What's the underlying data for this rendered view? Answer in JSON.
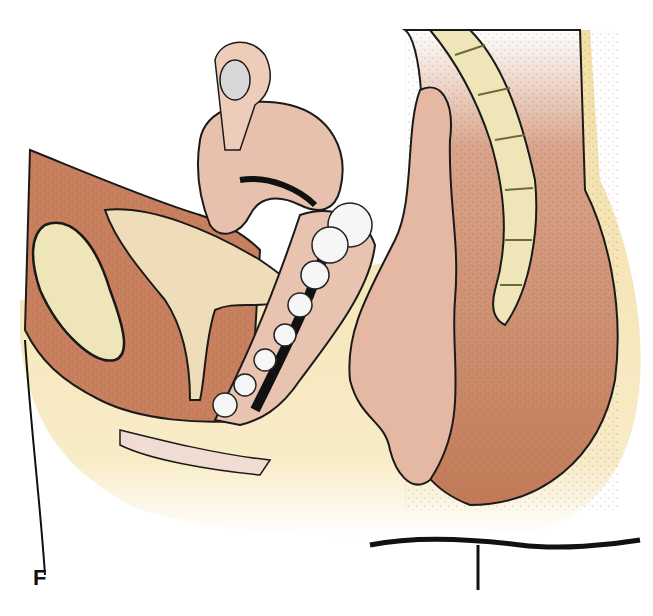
{
  "figure": {
    "panel_label": "F",
    "colors": {
      "background": "#ffffff",
      "tissue_brown": "#c8805e",
      "tissue_dark_brown": "#b86f4f",
      "pink_organ": "#e8c0ae",
      "light_pink": "#f0dcd2",
      "bone_cream": "#eee6b8",
      "skin_yellow": "#f3dfa6",
      "outline": "#1a1a1a",
      "lesion_white": "#f6f6f6",
      "ovary_grey": "#d8d8d8"
    }
  }
}
